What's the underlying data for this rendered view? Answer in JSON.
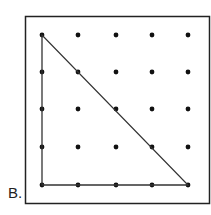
{
  "figure": {
    "label": "B.",
    "board": {
      "rows": 5,
      "cols": 5
    },
    "shape": {
      "type": "right-triangle",
      "vertices": [
        [
          0,
          0
        ],
        [
          0,
          4
        ],
        [
          4,
          4
        ]
      ]
    },
    "colors": {
      "line": "#333333",
      "dot": "#111111",
      "border": "#222222"
    }
  }
}
